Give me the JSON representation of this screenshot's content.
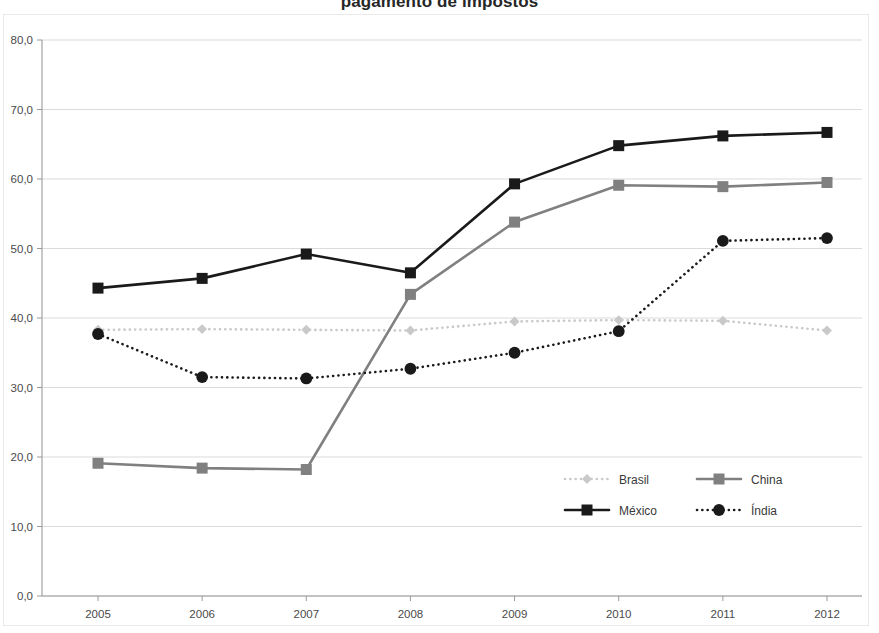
{
  "chart_data": {
    "type": "line",
    "title": "pagamento de impostos",
    "xlabel": "",
    "ylabel": "",
    "x": [
      "2005",
      "2006",
      "2007",
      "2008",
      "2009",
      "2010",
      "2011",
      "2012"
    ],
    "categories": [
      "2005",
      "2006",
      "2007",
      "2008",
      "2009",
      "2010",
      "2011",
      "2012"
    ],
    "ylim": [
      0,
      80
    ],
    "ytick_labels": [
      "80,0",
      "70,0",
      "60,0",
      "50,0",
      "40,0",
      "30,0",
      "20,0",
      "10,0",
      "0,0"
    ],
    "ytick_values": [
      80,
      70,
      60,
      50,
      40,
      30,
      20,
      10,
      0
    ],
    "grid": true,
    "legend_position": "inside-lower-right",
    "series": [
      {
        "name": "Brasil",
        "values": [
          38.3,
          38.4,
          38.3,
          38.2,
          39.5,
          39.7,
          39.6,
          38.2
        ],
        "color": "#c9c9c9",
        "line_style": "dotted",
        "marker": "diamond"
      },
      {
        "name": "China",
        "values": [
          19.1,
          18.4,
          18.2,
          43.4,
          53.8,
          59.1,
          58.9,
          59.5
        ],
        "color": "#808080",
        "line_style": "solid",
        "marker": "square"
      },
      {
        "name": "México",
        "values": [
          44.3,
          45.7,
          49.2,
          46.5,
          59.3,
          64.8,
          66.2,
          66.7
        ],
        "color": "#1a1a1a",
        "line_style": "solid",
        "marker": "square"
      },
      {
        "name": "Índia",
        "values": [
          37.7,
          31.5,
          31.3,
          32.7,
          35.0,
          38.1,
          51.1,
          51.5
        ],
        "color": "#1a1a1a",
        "line_style": "dotted",
        "marker": "circle"
      }
    ]
  },
  "legend": {
    "entries": [
      {
        "label": "Brasil"
      },
      {
        "label": "China"
      },
      {
        "label": "México"
      },
      {
        "label": "Índia"
      }
    ]
  },
  "axes": {
    "gridline_color": "#d7d7d7",
    "axis_color": "#9a9a9a",
    "background": "#ffffff"
  }
}
